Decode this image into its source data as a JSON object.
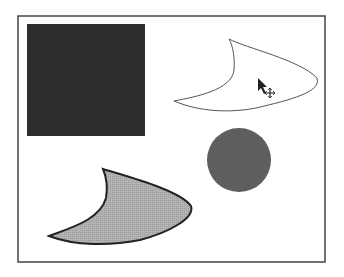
{
  "canvas": {
    "width": 344,
    "height": 277,
    "background": "#ffffff",
    "frame": {
      "x": 18,
      "y": 16,
      "width": 307,
      "height": 246,
      "stroke": "#444444"
    }
  },
  "shapes": {
    "square": {
      "x": 27,
      "y": 24,
      "width": 118,
      "height": 112,
      "fill": "#2e2e2e"
    },
    "outline_shape": {
      "fill": "#ffffff",
      "stroke": "#555555",
      "state": "selected-hover"
    },
    "circle": {
      "cx": 239,
      "cy": 160,
      "r": 32,
      "fill": "#5e5e5e"
    },
    "filled_shape": {
      "fill": "#b4b4b4",
      "stroke": "#222222"
    }
  },
  "cursor": {
    "type": "move-arrow",
    "x": 258,
    "y": 78
  }
}
